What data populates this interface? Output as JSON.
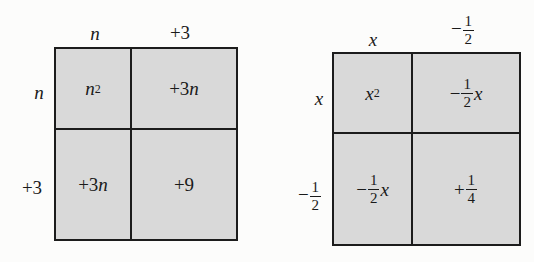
{
  "diagrams": [
    {
      "name": "area-model-n-plus-3",
      "column_headers": [
        "n",
        "+3"
      ],
      "row_headers": [
        "n",
        "+3"
      ],
      "cells": [
        [
          "n^2",
          "+3n"
        ],
        [
          "+3n",
          "+9"
        ]
      ],
      "labels": {
        "col1": "n",
        "col2": "+3",
        "row1": "n",
        "row2": "+3",
        "c11_base": "n",
        "c11_exp": "2",
        "c12_sign": "+3",
        "c12_var": "n",
        "c21_sign": "+3",
        "c21_var": "n",
        "c22": "+9"
      }
    },
    {
      "name": "area-model-x-minus-half",
      "column_headers": [
        "x",
        "-1/2"
      ],
      "row_headers": [
        "x",
        "-1/2"
      ],
      "cells": [
        [
          "x^2",
          "-1/2 x"
        ],
        [
          "-1/2 x",
          "+1/4"
        ]
      ],
      "labels": {
        "col1": "x",
        "col2_sign": "−",
        "col2_num": "1",
        "col2_den": "2",
        "row1": "x",
        "row2_sign": "−",
        "row2_num": "1",
        "row2_den": "2",
        "c11_base": "x",
        "c11_exp": "2",
        "c12_sign": "−",
        "c12_num": "1",
        "c12_den": "2",
        "c12_var": "x",
        "c21_sign": "−",
        "c21_num": "1",
        "c21_den": "2",
        "c21_var": "x",
        "c22_sign": "+",
        "c22_num": "1",
        "c22_den": "4"
      }
    }
  ],
  "colors": {
    "cell_fill": "#d9d9d9",
    "border": "#1c1c1c",
    "background": "#fcfcfb"
  }
}
